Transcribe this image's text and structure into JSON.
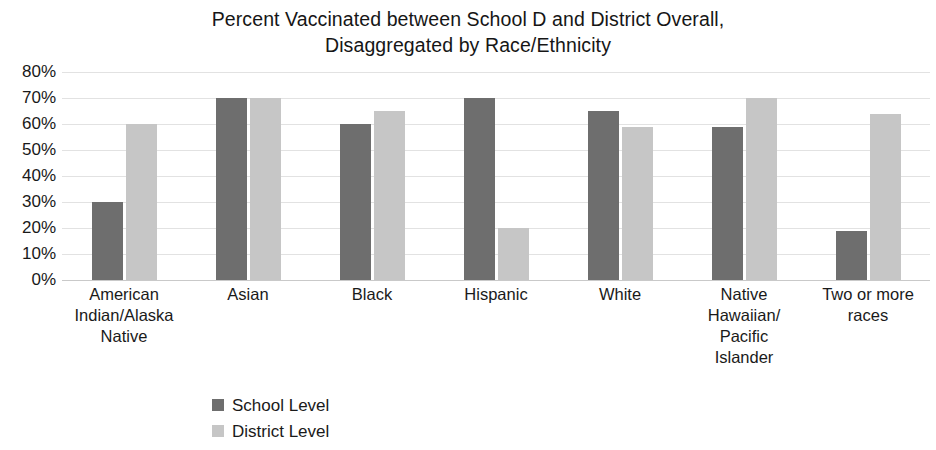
{
  "chart_data": {
    "type": "bar",
    "title": "Percent Vaccinated between School D and District Overall, Disaggregated by Race/Ethnicity",
    "title_lines": [
      "Percent Vaccinated between School D and District Overall,",
      "Disaggregated by Race/Ethnicity"
    ],
    "xlabel": "",
    "ylabel": "",
    "ylim": [
      0,
      80
    ],
    "ytick_step": 10,
    "ytick_labels": [
      "80%",
      "70%",
      "60%",
      "50%",
      "40%",
      "30%",
      "20%",
      "10%",
      "0%"
    ],
    "ytick_values": [
      80,
      70,
      60,
      50,
      40,
      30,
      20,
      10,
      0
    ],
    "grid": true,
    "legend_position": "bottom-left",
    "categories": [
      "American Indian/Alaska Native",
      "Asian",
      "Black",
      "Hispanic",
      "White",
      "Native Hawaiian/Pacific Islander",
      "Two or more races"
    ],
    "category_label_lines": [
      [
        "American",
        "Indian/Alaska",
        "Native"
      ],
      [
        "Asian"
      ],
      [
        "Black"
      ],
      [
        "Hispanic"
      ],
      [
        "White"
      ],
      [
        "Native",
        "Hawaiian/",
        "Pacific",
        "Islander"
      ],
      [
        "Two or more",
        "races"
      ]
    ],
    "series": [
      {
        "name": "School Level",
        "color": "#6e6e6e",
        "values": [
          30,
          70,
          60,
          70,
          65,
          59,
          19
        ]
      },
      {
        "name": "District Level",
        "color": "#c6c6c6",
        "values": [
          60,
          70,
          65,
          20,
          59,
          70,
          64
        ]
      }
    ]
  },
  "legend": {
    "items": [
      {
        "label": "School Level",
        "color": "#6e6e6e"
      },
      {
        "label": "District Level",
        "color": "#c6c6c6"
      }
    ]
  }
}
